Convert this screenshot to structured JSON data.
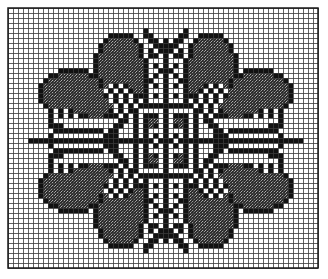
{
  "chart": {
    "title": "",
    "type": "cross-stitch pattern grid",
    "columns": 62,
    "rows": 52,
    "cell_px": 5,
    "origin": [
      8,
      8
    ],
    "colors": {
      "background": "#ffffff",
      "grid_line": "#3a3a3a",
      "solid": "#111111",
      "stipple": "#5a5a5a",
      "border": "#1a1a1a"
    },
    "legend": {
      "#": "solid black stitch",
      "s": "stippled / shaded stitch",
      ".": "empty cell"
    },
    "symmetry": "four-fold mirror about center column 31 and center row 26",
    "quadrant_top_left": [
      "................................",
      "................................",
      "................................",
      "................................",
      "...........................#....",
      "....................#####..##...",
      "...................#sssss#..##.#",
      "..................#sssssss#..###",
      "..................#sssssss#.#.##",
      ".................#ssssssss#.##.#",
      ".................#sssssssss#...#",
      ".................#sssssssss#.#.#",
      "..........######.#sssssssss#..##",
      "........##ssssss##sssssssss#.#.#",
      ".......#ssssssssss#ssssssss##..#",
      "......#sssssssssss#s.#.#sss#.#.#",
      "......#ssssssssssss.#.#.#ss#...#",
      "......#ssssssssssss#.#.#.###.#.#",
      "......#sssssssssssss.#.#.#.#...#",
      ".......#sssssssssssss.#.#.######",
      "........#.#.#sssssss#.#.##.....#",
      "........#.#.#.##sss###.#.#.###.#",
      "........#.............##.#.#ss.#",
      "........###..........##..#.#s#.#",
      ".........##########.##...#.#...#",
      "........#..........###...#.#.#.#",
      "....#########################.##"
    ]
  }
}
